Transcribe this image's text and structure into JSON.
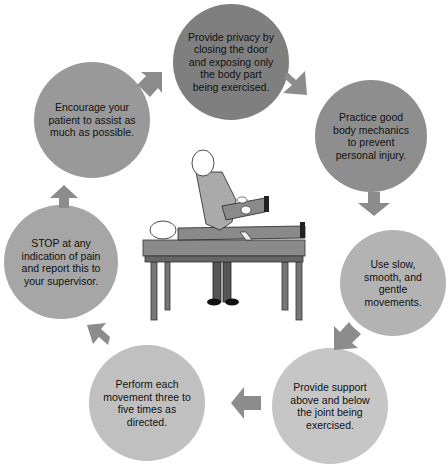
{
  "diagram": {
    "title": "",
    "steps": [
      {
        "text": "Provide privacy by closing the door and exposing only the body part being exercised.",
        "color": "#7f7f7f"
      },
      {
        "text": "Practice good body mechanics to prevent personal injury.",
        "color": "#8e8e8e"
      },
      {
        "text": "Use slow, smooth, and gentle movements.",
        "color": "#b3b3b3"
      },
      {
        "text": "Provide support above and below the joint being exercised.",
        "color": "#c6c6c6"
      },
      {
        "text": "Perform each movement three to five times as directed.",
        "color": "#c0c0c0"
      },
      {
        "text": "STOP at any indication of pain and report this to your supervisor.",
        "color": "#a6a6a6"
      },
      {
        "text": "Encourage your patient to assist as much as possible.",
        "color": "#999999"
      }
    ],
    "center_illustration": "caregiver-performing-range-of-motion-exercise-on-patient-lying-on-table",
    "arrow_color": "#8c8c8c"
  }
}
